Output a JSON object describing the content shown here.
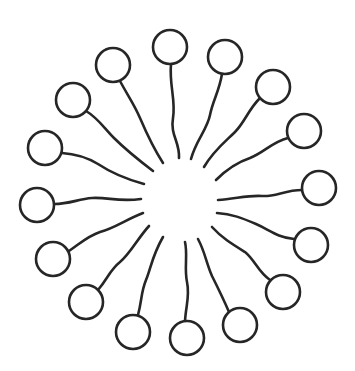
{
  "diagram": {
    "type": "micelle",
    "background": "#ffffff",
    "stroke_color": "#262626",
    "head_radius": 17,
    "core_center": [
      180,
      200
    ],
    "molecules": [
      {
        "id": 1,
        "head": [
          170,
          47
        ],
        "tail": "M171,64 C169,85 176,100 173,118 C170,135 180,142 179,158"
      },
      {
        "id": 2,
        "head": [
          225,
          57
        ],
        "tail": "M222,74 C219,92 213,100 210,115 C207,130 196,140 191,159"
      },
      {
        "id": 3,
        "head": [
          273,
          87
        ],
        "tail": "M260,98 C248,110 245,122 235,132 C225,142 214,150 204,167"
      },
      {
        "id": 4,
        "head": [
          304,
          131
        ],
        "tail": "M288,138 C272,142 265,152 250,158 C238,162 228,168 216,180"
      },
      {
        "id": 5,
        "head": [
          319,
          188
        ],
        "tail": "M302,190 C285,190 275,197 262,196 C248,195 235,199 218,200"
      },
      {
        "id": 6,
        "head": [
          311,
          245
        ],
        "tail": "M294,239 C276,237 270,230 256,224 C242,218 232,214 217,213"
      },
      {
        "id": 7,
        "head": [
          283,
          292
        ],
        "tail": "M270,280 C258,272 255,260 245,252 C232,244 222,238 212,227"
      },
      {
        "id": 8,
        "head": [
          240,
          325
        ],
        "tail": "M229,312 C223,298 219,290 212,276 C206,262 205,252 198,239"
      },
      {
        "id": 9,
        "head": [
          187,
          338
        ],
        "tail": "M185,321 C186,305 190,296 187,282 C184,268 188,255 185,242"
      },
      {
        "id": 10,
        "head": [
          133,
          332
        ],
        "tail": "M138,315 C142,300 141,292 146,280 C151,268 152,256 163,237"
      },
      {
        "id": 11,
        "head": [
          86,
          302
        ],
        "tail": "M98,290 C108,278 110,270 120,262 C130,254 138,238 149,226"
      },
      {
        "id": 12,
        "head": [
          53,
          259
        ],
        "tail": "M69,251 C82,242 88,236 100,232 C115,228 125,220 143,213"
      },
      {
        "id": 13,
        "head": [
          37,
          205
        ],
        "tail": "M54,204 C70,204 78,199 92,198 C108,197 118,202 141,199"
      },
      {
        "id": 14,
        "head": [
          45,
          148
        ],
        "tail": "M62,153 C78,154 88,158 98,164 C110,172 122,178 144,184"
      },
      {
        "id": 15,
        "head": [
          73,
          100
        ],
        "tail": "M86,111 C98,118 104,128 114,138 C124,148 136,158 153,171"
      },
      {
        "id": 16,
        "head": [
          113,
          65
        ],
        "tail": "M120,81 C128,96 134,104 140,118 C146,132 152,146 163,163"
      }
    ]
  }
}
